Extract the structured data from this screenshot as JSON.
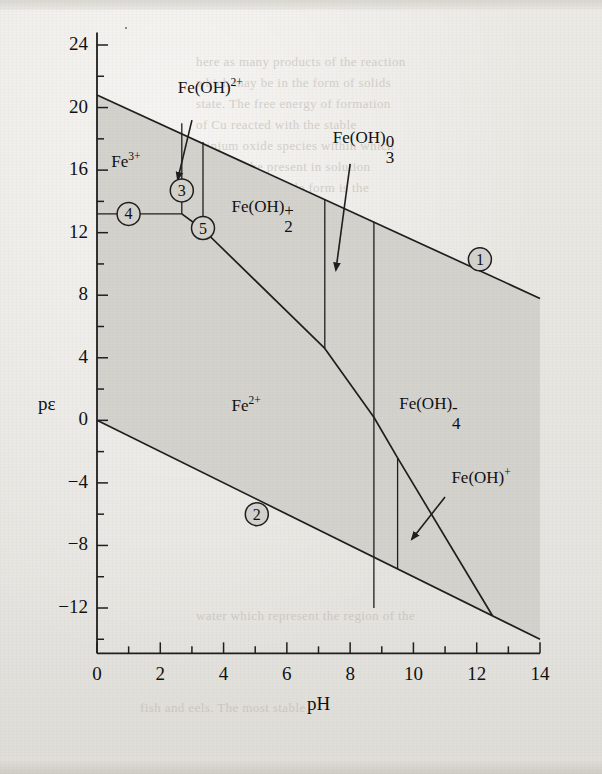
{
  "figure": {
    "kind": "pourbaix-diagram",
    "axis_x_label": "pH",
    "axis_y_label": "pε",
    "background_color": "#e8e6e1",
    "shaded_field_color": "#d2d0cb",
    "line_color": "#1f1f1f"
  },
  "axes": {
    "x": {
      "label": "pH",
      "min": 0,
      "max": 14,
      "major_step": 2,
      "minor_step": 1,
      "ticks": [
        "0",
        "2",
        "4",
        "6",
        "8",
        "10",
        "12",
        "14"
      ]
    },
    "y": {
      "label": "pε",
      "min": -14,
      "max": 24,
      "major_step": 4,
      "minor_step": 2,
      "ticks": [
        "24",
        "20",
        "16",
        "12",
        "8",
        "4",
        "0",
        "-4",
        "-8",
        "-12"
      ]
    }
  },
  "species_labels": [
    {
      "id": "fe3",
      "base": "Fe",
      "sup": "3+",
      "sub": "",
      "tail": "",
      "text": "Fe3+"
    },
    {
      "id": "feoh2p",
      "base": "Fe(OH)",
      "sup": "2+",
      "sub": "",
      "tail": "",
      "text": "Fe(OH)2+"
    },
    {
      "id": "feoh2_1",
      "base": "Fe(OH)",
      "sup": "+",
      "sub": "2",
      "tail": "",
      "text": "Fe(OH)2+"
    },
    {
      "id": "feoh3_0",
      "base": "Fe(OH)",
      "sup": "0",
      "sub": "3",
      "tail": "",
      "text": "Fe(OH)30"
    },
    {
      "id": "fe2",
      "base": "Fe",
      "sup": "2+",
      "sub": "",
      "tail": "",
      "text": "Fe2+"
    },
    {
      "id": "feoh4m",
      "base": "Fe(OH)",
      "sup": "-",
      "sub": "4",
      "tail": "",
      "text": "Fe(OH)4-"
    },
    {
      "id": "feohp",
      "base": "Fe(OH)",
      "sup": "+",
      "sub": "",
      "tail": "",
      "text": "Fe(OH)+"
    }
  ],
  "markers": [
    {
      "label": "1",
      "pH": 12.1,
      "pe": 10.3
    },
    {
      "label": "2",
      "pH": 5.05,
      "pe": -6.0
    },
    {
      "label": "3",
      "pH": 2.68,
      "pe": 14.7
    },
    {
      "label": "4",
      "pH": 1.0,
      "pe": 13.2
    },
    {
      "label": "5",
      "pH": 3.35,
      "pe": 12.3
    }
  ],
  "chart_data": {
    "type": "line",
    "title": "",
    "xlabel": "pH",
    "ylabel": "pε",
    "xlim": [
      0,
      14
    ],
    "ylim": [
      -14,
      24
    ],
    "grid": false,
    "legend": "none",
    "shaded_region": "water stability field between line 1 (O2/H2O) and line 2 (H2O/H2)",
    "series": [
      {
        "name": "1",
        "note": "upper water stability limit",
        "x": [
          0,
          14
        ],
        "y": [
          20.8,
          7.8
        ]
      },
      {
        "name": "2",
        "note": "lower water stability limit",
        "x": [
          0,
          14
        ],
        "y": [
          0,
          -14
        ]
      },
      {
        "name": "3",
        "note": "Fe3+ / Fe(OH)2+ vertical boundary",
        "x": [
          2.68,
          2.68
        ],
        "y": [
          19.0,
          13.2
        ]
      },
      {
        "name": "4",
        "note": "Fe3+ / Fe2+ horizontal boundary",
        "x": [
          0,
          2.68
        ],
        "y": [
          13.2,
          13.2
        ]
      },
      {
        "name": "5",
        "note": "Fe(OH)2+ / Fe(OH)2+ vertical boundary",
        "x": [
          3.35,
          3.35
        ],
        "y": [
          17.8,
          12.2
        ]
      },
      {
        "name": "redox-Fe3-Fe2",
        "note": "Fe(III)/Fe(II) boundary curve",
        "x": [
          2.68,
          3.35,
          7.2,
          8.75,
          9.5,
          12.5
        ],
        "y": [
          13.2,
          12.2,
          4.6,
          0.2,
          -2.4,
          -12.5
        ]
      },
      {
        "name": "v-7.2",
        "note": "Fe(OH)2+ / Fe(OH)30 vertical boundary",
        "x": [
          7.2,
          7.2
        ],
        "y": [
          14.1,
          4.6
        ]
      },
      {
        "name": "v-8.75",
        "note": "Fe(OH)30 / Fe(OH)4- vertical boundary",
        "x": [
          8.75,
          8.75
        ],
        "y": [
          12.7,
          -12.0
        ]
      },
      {
        "name": "v-9.5",
        "note": "Fe2+ / Fe(OH)+ vertical boundary",
        "x": [
          9.5,
          9.5
        ],
        "y": [
          -2.4,
          -9.5
        ]
      }
    ]
  },
  "ghost_text": {
    "lines": [
      {
        "t": "here as many products of the reaction",
        "x": 196,
        "y": 54,
        "s": 13,
        "i": false
      },
      {
        "t": "which may be in the form of solids",
        "x": 196,
        "y": 75,
        "s": 13,
        "i": false
      },
      {
        "t": "state. The free energy of formation",
        "x": 196,
        "y": 96,
        "s": 13,
        "i": false
      },
      {
        "t": "of Cu reacted with the stable",
        "x": 196,
        "y": 117,
        "s": 13,
        "i": false
      },
      {
        "t": "minium oxide species within which",
        "x": 196,
        "y": 138,
        "s": 13,
        "i": false
      },
      {
        "t": "ions may be present in solution",
        "x": 196,
        "y": 159,
        "s": 13,
        "i": false
      },
      {
        "t": "that the most stable form is the",
        "x": 196,
        "y": 180,
        "s": 13,
        "i": false
      },
      {
        "t": "the reaction may proceed",
        "x": 330,
        "y": 440,
        "s": 13,
        "i": false
      },
      {
        "t": "the potential for reducing",
        "x": 330,
        "y": 461,
        "s": 13,
        "i": false
      },
      {
        "t": "can be obtained by plotting",
        "x": 330,
        "y": 482,
        "s": 13,
        "i": false
      },
      {
        "t": "diagram showing the stability",
        "x": 330,
        "y": 503,
        "s": 13,
        "i": false
      },
      {
        "t": "water which represent the region of the",
        "x": 196,
        "y": 608,
        "s": 13,
        "i": false
      },
      {
        "t": "fish and eels. The most stable",
        "x": 140,
        "y": 700,
        "s": 13,
        "i": false
      }
    ]
  }
}
